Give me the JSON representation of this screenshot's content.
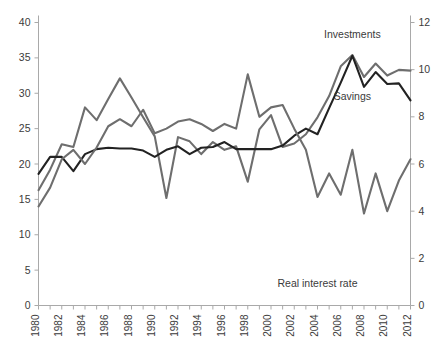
{
  "chart_data": {
    "type": "line",
    "title": "",
    "xlabel": "",
    "ylabel": "",
    "y2label": "",
    "grid": false,
    "legend": "inline-annotations",
    "x": [
      1980,
      1981,
      1982,
      1983,
      1984,
      1985,
      1986,
      1987,
      1988,
      1989,
      1990,
      1991,
      1992,
      1993,
      1994,
      1995,
      1996,
      1997,
      1998,
      1999,
      2000,
      2001,
      2002,
      2003,
      2004,
      2005,
      2006,
      2007,
      2008,
      2009,
      2010,
      2011,
      2012
    ],
    "ylim": [
      0,
      40
    ],
    "yticks": [
      0,
      5,
      10,
      15,
      20,
      25,
      30,
      35,
      40
    ],
    "y2lim": [
      0,
      12
    ],
    "y2ticks": [
      0,
      2,
      4,
      6,
      8,
      10,
      12
    ],
    "xticks": [
      1980,
      1982,
      1984,
      1986,
      1988,
      1990,
      1992,
      1994,
      1996,
      1998,
      2000,
      2002,
      2004,
      2006,
      2008,
      2010,
      2012
    ],
    "xtick_labels": [
      "1980",
      "1982",
      "1984",
      "1986",
      "1988",
      "1990",
      "1992",
      "1994",
      "1996",
      "1998",
      "2000",
      "2002",
      "2004",
      "2006",
      "2008",
      "2010",
      "2012"
    ],
    "ytick_labels": [
      "0",
      "5",
      "10",
      "15",
      "20",
      "25",
      "30",
      "35",
      "40"
    ],
    "y2tick_labels": [
      "0",
      "2",
      "4",
      "6",
      "8",
      "10",
      "12"
    ],
    "series": [
      {
        "name": "Investments",
        "axis": "left",
        "color": "#6e6e6e",
        "label_x": 2007,
        "label_y": 37.8,
        "values": [
          16.3,
          19.2,
          22.8,
          22.4,
          28.0,
          26.2,
          29.2,
          32.1,
          29.4,
          26.6,
          23.9,
          15.2,
          23.8,
          23.2,
          21.4,
          23.1,
          22.0,
          22.5,
          17.5,
          24.9,
          26.9,
          22.4,
          22.9,
          24.2,
          26.6,
          29.6,
          33.8,
          35.4,
          32.3,
          34.2,
          32.5,
          33.3,
          33.2
        ]
      },
      {
        "name": "Savings",
        "axis": "left",
        "color": "#222222",
        "label_x": 2007,
        "label_y": 29.0,
        "values": [
          18.6,
          21.0,
          21.0,
          19.0,
          21.4,
          22.1,
          22.3,
          22.2,
          22.2,
          21.9,
          21.0,
          22.0,
          22.5,
          21.4,
          22.3,
          22.4,
          23.1,
          22.1,
          22.1,
          22.1,
          22.1,
          22.6,
          24.0,
          25.0,
          24.2,
          27.9,
          31.5,
          35.3,
          30.9,
          33.0,
          31.3,
          31.4,
          29.0
        ]
      },
      {
        "name": "Real interest rate",
        "axis": "right",
        "color": "#6e6e6e",
        "label_x": 2004,
        "label_y": 2.55,
        "values": [
          4.2,
          5.0,
          6.2,
          6.6,
          6.0,
          6.7,
          7.6,
          7.9,
          7.6,
          8.3,
          7.3,
          7.5,
          7.8,
          7.9,
          7.7,
          7.4,
          7.7,
          7.5,
          9.8,
          8.0,
          8.4,
          8.5,
          7.5,
          6.6,
          4.6,
          5.6,
          4.7,
          6.6,
          3.9,
          5.6,
          4.0,
          5.3,
          6.2
        ]
      }
    ],
    "annotations": [
      {
        "text": "Investments",
        "x": 2007,
        "y": 37.8
      },
      {
        "text": "Savings",
        "x": 2007,
        "y": 29.0
      },
      {
        "text": "Real interest rate",
        "x": 2004,
        "y": 2.55
      }
    ]
  }
}
